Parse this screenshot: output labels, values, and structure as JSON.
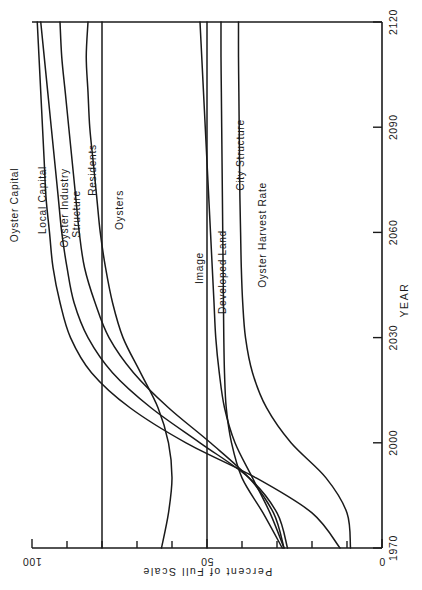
{
  "chart_data": {
    "type": "line",
    "title": "",
    "orientation": "rotated-90ccw",
    "xlabel": "Percent of Full Scale",
    "ylabel": "YEAR",
    "xlim": [
      0,
      100
    ],
    "ylim": [
      1970,
      2120
    ],
    "grid": false,
    "legend_position": "inline-curve-labels",
    "x_ticks": [
      0,
      10,
      20,
      30,
      40,
      50,
      60,
      70,
      80,
      90,
      100
    ],
    "x_tick_labels": [
      "0",
      "",
      "",
      "",
      "",
      "50",
      "",
      "",
      "",
      "",
      "100"
    ],
    "y_ticks": [
      1970,
      2000,
      2030,
      2060,
      2090,
      2120
    ],
    "y_tick_labels": [
      "1970",
      "2000",
      "2030",
      "2060",
      "2090",
      "2120"
    ],
    "years": [
      1970,
      1980,
      1990,
      2000,
      2010,
      2020,
      2030,
      2040,
      2050,
      2060,
      2070,
      2080,
      2090,
      2100,
      2110,
      2120
    ],
    "series": [
      {
        "name": "Oyster Capital",
        "label": "Oyster  Capital",
        "values": [
          12,
          20,
          36,
          56,
          72,
          83,
          89,
          92,
          94,
          95,
          96,
          96.5,
          97,
          97.5,
          98,
          98.5
        ]
      },
      {
        "name": "Local Capital",
        "label": "Local  Capital",
        "values": [
          27,
          30,
          38,
          52,
          66,
          77,
          84,
          88,
          90,
          91.5,
          92.5,
          93.5,
          94.5,
          95.5,
          96.5,
          97.5
        ]
      },
      {
        "name": "Oyster Industry Structure",
        "label": "Oyster  Industry\nStructure",
        "values": [
          28,
          31,
          38,
          49,
          61,
          71,
          78,
          82,
          85,
          86.5,
          87.5,
          88.5,
          89.5,
          90.5,
          91.5,
          92
        ]
      },
      {
        "name": "Residents",
        "label": "Residents",
        "values": [
          63,
          61,
          60,
          61,
          64,
          69,
          74,
          77,
          79,
          80.5,
          81.5,
          82.5,
          83.5,
          84,
          84.5,
          84
        ]
      },
      {
        "name": "Oysters",
        "label": "Oysters",
        "values": [
          80,
          80,
          80,
          80,
          80,
          80,
          80,
          80,
          80,
          80,
          80,
          80,
          80,
          80,
          80,
          80
        ]
      },
      {
        "name": "Image",
        "label": "Image",
        "values": [
          50,
          50,
          50,
          50,
          50,
          50,
          50,
          50,
          50,
          50,
          50,
          50,
          50,
          50,
          50,
          50
        ]
      },
      {
        "name": "Developed Land",
        "label": "Developed  Land",
        "values": [
          28,
          32,
          37,
          42,
          45,
          46.5,
          47.5,
          48,
          48.5,
          49,
          49.5,
          50,
          50.5,
          51,
          51.5,
          52
        ]
      },
      {
        "name": "City Structure",
        "label": "City  Structure",
        "values": [
          28.5,
          34,
          40,
          43,
          44.5,
          45,
          45.2,
          45.3,
          45.4,
          45.5,
          45.6,
          45.7,
          45.8,
          45.9,
          46,
          46
        ]
      },
      {
        "name": "Oyster Harvest Rate",
        "label": "Oyster  Harvest  Rate",
        "values": [
          9,
          10,
          16,
          26,
          33,
          37,
          39,
          39.8,
          40.2,
          40.4,
          40.6,
          40.7,
          40.8,
          40.9,
          41,
          41
        ]
      }
    ]
  },
  "axes": {
    "percent": {
      "title": "Percent  of  Full  Scale",
      "labels": {
        "zero": "0",
        "mid": "50",
        "full": "100"
      }
    },
    "year": {
      "title": "YEAR",
      "labels": [
        "1970",
        "2000",
        "2030",
        "2060",
        "2090",
        "2120"
      ]
    }
  },
  "curve_labels": {
    "oyster_capital": "Oyster  Capital",
    "local_capital": "Local  Capital",
    "oyster_industry_structure_line1": "Oyster  Industry",
    "oyster_industry_structure_line2": "Structure",
    "residents": "Residents",
    "oysters": "Oysters",
    "image": "Image",
    "developed_land": "Developed  Land",
    "city_structure": "City  Structure",
    "oyster_harvest_rate": "Oyster  Harvest  Rate"
  }
}
